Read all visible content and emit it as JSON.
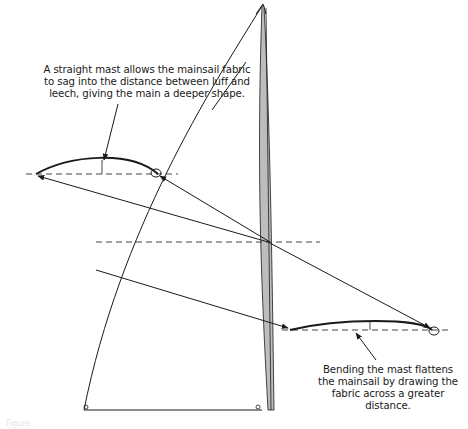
{
  "diagram": {
    "annotations": {
      "straight_mast": "A straight mast allows the mainsail fabric to sag into the distance between luff and leech, giving the main a deeper shape.",
      "bent_mast": "Bending the mast flattens the mainsail  by drawing the fabric across a greater distance."
    },
    "elements": [
      {
        "id": "sail-outline",
        "label": "mainsail (head, luff curve, leech, foot)"
      },
      {
        "id": "mast",
        "label": "bent mast (shaded)"
      },
      {
        "id": "section-deep",
        "label": "deep sail section with straight mast"
      },
      {
        "id": "section-flat",
        "label": "flat sail section with bent mast"
      },
      {
        "id": "chord-lines",
        "label": "dashed chord lines"
      },
      {
        "id": "projection-lines",
        "label": "projection lines with arrowheads"
      }
    ],
    "caption": "Figure"
  },
  "colors": {
    "line": "#1a1a1a",
    "dashed": "#444444",
    "mast_fill": "#bdbdbd",
    "background": "#ffffff"
  }
}
